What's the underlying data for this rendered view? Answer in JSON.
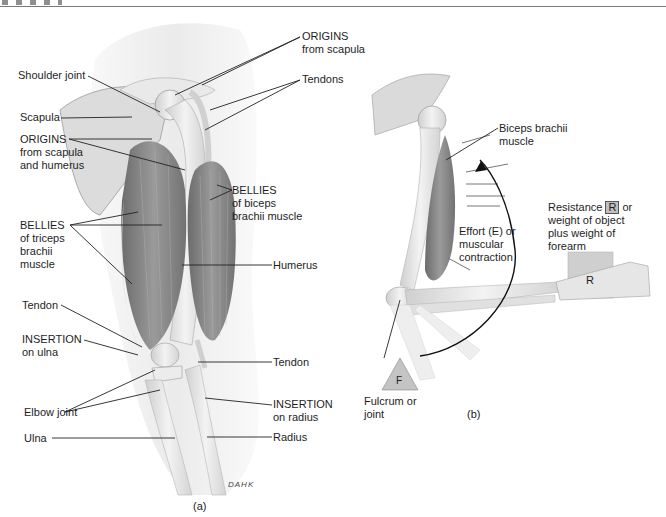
{
  "figure": {
    "panel_a_caption": "(a)",
    "panel_b_caption": "(b)",
    "artist_signature": "DAHK"
  },
  "panel_a": {
    "labels": {
      "origins_scapula_title": "ORIGINS",
      "origins_scapula_sub": "from scapula",
      "shoulder_joint": "Shoulder joint",
      "scapula": "Scapula",
      "tendons": "Tendons",
      "origins_sh_title": "ORIGINS",
      "origins_sh_sub1": "from scapula",
      "origins_sh_sub2": "and humerus",
      "bellies_biceps_title": "BELLIES",
      "bellies_biceps_sub1": "of biceps",
      "bellies_biceps_sub2": "brachii muscle",
      "bellies_triceps_title": "BELLIES",
      "bellies_triceps_sub1": "of triceps",
      "bellies_triceps_sub2": "brachii",
      "bellies_triceps_sub3": "muscle",
      "humerus": "Humerus",
      "tendon_left": "Tendon",
      "insertion_ulna_title": "INSERTION",
      "insertion_ulna_sub": "on ulna",
      "tendon_right": "Tendon",
      "elbow_joint": "Elbow joint",
      "insertion_radius_title": "INSERTION",
      "insertion_radius_sub": "on radius",
      "ulna": "Ulna",
      "radius": "Radius"
    }
  },
  "panel_b": {
    "labels": {
      "biceps_1": "Biceps brachii",
      "biceps_2": "muscle",
      "resistance_pre": "Resistance",
      "resistance_box": "R",
      "resistance_post": "or",
      "resistance_2": "weight of object",
      "resistance_3": "plus weight of",
      "resistance_4": "forearm",
      "effort_1": "Effort (E) or",
      "effort_2": "muscular",
      "effort_3": "contraction",
      "fulcrum_symbol": "F",
      "fulcrum_1": "Fulcrum or",
      "fulcrum_2": "joint",
      "load_symbol": "R"
    }
  },
  "colors": {
    "muscle": "#8c8c8c",
    "muscle_dark": "#6e6e6e",
    "bone": "#e6e6e6",
    "skin": "#efefef",
    "leader_line": "#222222",
    "load_box": "#cfcfcf"
  }
}
